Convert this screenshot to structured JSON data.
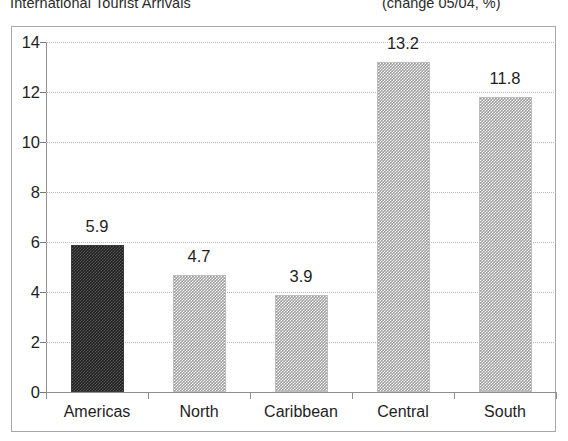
{
  "header": {
    "title": "International Tourist Arrivals",
    "units": "(change 05/04, %)"
  },
  "chart_data": {
    "type": "bar",
    "title": "International Tourist Arrivals",
    "subtitle": "(change 05/04, %)",
    "categories": [
      "Americas",
      "North",
      "Caribbean",
      "Central",
      "South"
    ],
    "values": [
      5.9,
      4.7,
      3.9,
      13.2,
      11.8
    ],
    "data_labels": [
      "5.9",
      "4.7",
      "3.9",
      "13.2",
      "11.8"
    ],
    "series": [
      {
        "name": "change 05/04, %",
        "values": [
          5.9,
          4.7,
          3.9,
          13.2,
          11.8
        ]
      }
    ],
    "highlighted_category": "Americas",
    "bar_styles": [
      "dark",
      "light",
      "light",
      "light",
      "light"
    ],
    "xlabel": "",
    "ylabel": "",
    "ylim": [
      0,
      14
    ],
    "ytick_labels": [
      "0",
      "2",
      "4",
      "6",
      "8",
      "10",
      "12",
      "14"
    ],
    "ytick_values": [
      0,
      2,
      4,
      6,
      8,
      10,
      12,
      14
    ],
    "grid": true,
    "grid_axis": "y",
    "legend": false,
    "colors": {
      "bar_dark": "#1d1d1d",
      "bar_light": "#9a9a9a",
      "gridline": "#b9b9b9",
      "axis": "#8f8f8f",
      "frame": "#a8a8a8",
      "text": "#1e1e1e",
      "background": "#ffffff"
    }
  }
}
